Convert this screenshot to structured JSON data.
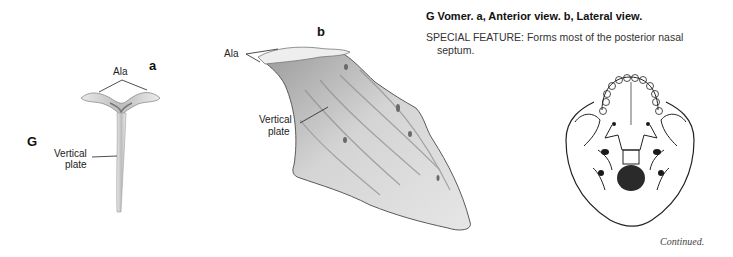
{
  "figure": {
    "letter": "G",
    "caption_title": "G Vomer. a, Anterior view. b, Lateral view.",
    "special_feature": "SPECIAL FEATURE: Forms most of the posterior nasal",
    "special_feature_cont": "septum.",
    "continued": "Continued."
  },
  "view_a": {
    "letter": "a",
    "labels": {
      "ala": "Ala",
      "vertical_plate_1": "Vertical",
      "vertical_plate_2": "plate"
    }
  },
  "view_b": {
    "letter": "b",
    "labels": {
      "ala": "Ala",
      "vertical_plate_1": "Vertical",
      "vertical_plate_2": "plate"
    }
  },
  "colors": {
    "bone_fill": "#d9d9d9",
    "bone_shade": "#a8a8a8",
    "outline": "#555555",
    "leader": "#222222"
  }
}
